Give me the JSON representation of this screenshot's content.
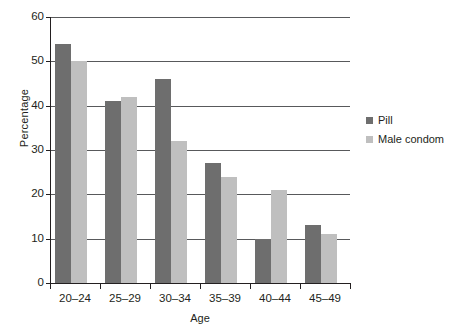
{
  "chart_data": {
    "type": "bar",
    "title": "",
    "xlabel": "Age",
    "ylabel": "Percentage",
    "categories": [
      "20–24",
      "25–29",
      "30–34",
      "35–39",
      "40–44",
      "45–49"
    ],
    "series": [
      {
        "name": "Pill",
        "color": "#6e6e6e",
        "values": [
          54,
          41,
          46,
          27,
          10,
          13
        ]
      },
      {
        "name": "Male condom",
        "color": "#bfbfbf",
        "values": [
          50,
          42,
          32,
          24,
          21,
          11
        ]
      }
    ],
    "ylim": [
      0,
      60
    ],
    "yticks": [
      0,
      10,
      20,
      30,
      40,
      50,
      60
    ],
    "ytick_labels": [
      "0",
      "10",
      "20",
      "30",
      "40",
      "50",
      "60"
    ],
    "grid": true,
    "grid_axis": "y",
    "legend_position": "right",
    "legend": [
      "Pill",
      "Male condom"
    ],
    "axis_color": "#231f20",
    "grid_color": "#58595b",
    "background": "#ffffff"
  }
}
